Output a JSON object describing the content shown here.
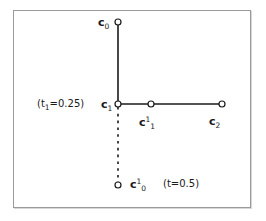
{
  "figure": {
    "background_color": "#ffffff",
    "frame": {
      "border_color": "#9a9a9a",
      "shadow_color": "#d8d8d8"
    },
    "line_color": "#1a1a1a",
    "marker": {
      "fill": "#ffffff",
      "stroke": "#1a1a1a",
      "radius": 3
    }
  },
  "labels": {
    "c0": {
      "base": "c",
      "sub": "0",
      "sup": ""
    },
    "c1": {
      "base": "c",
      "sub": "1",
      "sup": ""
    },
    "c2": {
      "base": "c",
      "sub": "2",
      "sup": ""
    },
    "c1_1": {
      "base": "c",
      "sub": "1",
      "sup": "1"
    },
    "c0_1": {
      "base": "c",
      "sub": "0",
      "sup": "1"
    },
    "t1_annotation": {
      "open": "(",
      "param": "t",
      "sub": "1",
      "equals": "=0.25",
      "close": ")"
    },
    "t_annotation": {
      "open": "(",
      "param": "t",
      "sub": "",
      "equals": "=0.5",
      "close": ")"
    }
  },
  "geometry": {
    "points": [
      {
        "name": "c0",
        "x": 118,
        "y": 22
      },
      {
        "name": "c1",
        "x": 118,
        "y": 104
      },
      {
        "name": "c1_1",
        "x": 151,
        "y": 104
      },
      {
        "name": "c2",
        "x": 222,
        "y": 104
      },
      {
        "name": "c0_1",
        "x": 118,
        "y": 185
      }
    ],
    "segments": [
      {
        "name": "c0-to-c1",
        "from": "c0",
        "to": "c1",
        "style": "solid"
      },
      {
        "name": "c1-to-c2",
        "from": "c1",
        "to": "c2",
        "style": "solid"
      },
      {
        "name": "c1-to-c0_1",
        "from": "c1",
        "to": "c0_1",
        "style": "dashed"
      }
    ]
  }
}
